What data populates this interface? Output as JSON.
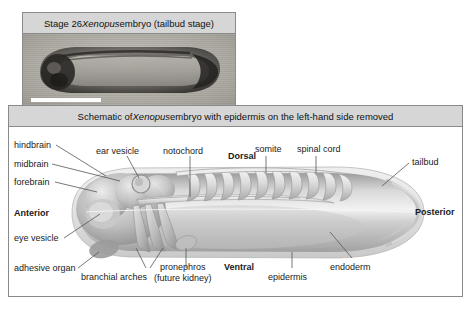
{
  "figure": {
    "photo_panel": {
      "caption_prefix": "Stage 26 ",
      "caption_italic": "Xenopus",
      "caption_suffix": " embryo (tailbud stage)",
      "caption_full": "Stage 26 Xenopus embryo (tailbud stage)",
      "image_alt": "grayscale-micrograph-of-tailbud-stage-embryo",
      "scale_bar": ""
    },
    "schematic_panel": {
      "caption_prefix": "Schematic of ",
      "caption_italic": "Xenopus",
      "caption_suffix": " embryo with epidermis on the left-hand side removed",
      "caption_full": "Schematic of Xenopus embryo with epidermis on the left-hand side removed"
    },
    "labels": {
      "hindbrain": "hindbrain",
      "midbrain": "midbrain",
      "forebrain": "forebrain",
      "anterior": "Anterior",
      "eye_vesicle": "eye vesicle",
      "adhesive_organ": "adhesive organ",
      "ear_vesicle": "ear vesicle",
      "notochord": "notochord",
      "dorsal": "Dorsal",
      "somite": "somite",
      "spinal_cord": "spinal cord",
      "tailbud": "tailbud",
      "posterior": "Posterior",
      "endoderm": "endoderm",
      "epidermis": "epidermis",
      "ventral": "Ventral",
      "pronephros_line1": "pronephros",
      "pronephros_line2": "(future kidney)",
      "branchial_arches": "branchial arches"
    },
    "colors": {
      "panel_border": "#8a8a8a",
      "caption_bg": "#d6d6d6",
      "text": "#1a1a1a",
      "leader_line": "#555555",
      "embryo_light": "#e8e8e8",
      "embryo_mid": "#b9b9b9",
      "embryo_dark": "#8e8e8e",
      "page_bg": "#ffffff"
    }
  }
}
